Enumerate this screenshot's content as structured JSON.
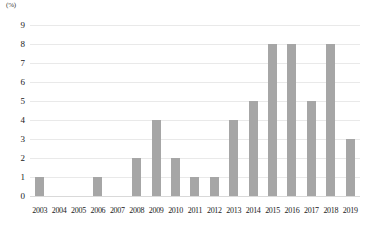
{
  "chart_data": {
    "type": "bar",
    "title": "",
    "subtitle": "",
    "xlabel": "",
    "ylabel": "",
    "unit_label": "(%)",
    "categories": [
      "2003",
      "2004",
      "2005",
      "2006",
      "2007",
      "2008",
      "2009",
      "2010",
      "2011",
      "2012",
      "2013",
      "2014",
      "2015",
      "2016",
      "2017",
      "2018",
      "2019"
    ],
    "values": [
      1,
      0,
      0,
      1,
      0,
      2,
      4,
      2,
      1,
      1,
      4,
      5,
      8,
      8,
      5,
      8,
      3
    ],
    "ylim": [
      0,
      9
    ],
    "ytick_labels": [
      "9",
      "8",
      "7",
      "6",
      "5",
      "4",
      "3",
      "2",
      "1",
      "0"
    ],
    "ytick_values": [
      9,
      8,
      7,
      6,
      5,
      4,
      3,
      2,
      1,
      0
    ],
    "grid": true,
    "legend": false,
    "legend_position": "none",
    "bar_color": "#a6a6a6",
    "gridline_color": "#e9e9e9",
    "axis_color": "#d9d9d9",
    "text_color": "#1a1a1a"
  }
}
